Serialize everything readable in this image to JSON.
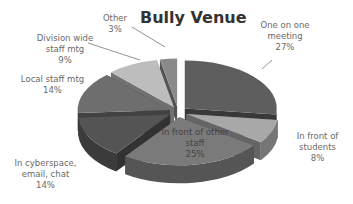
{
  "chart_data": {
    "type": "pie",
    "style": "3d-exploded",
    "title": "Bully Venue",
    "categories": [
      "One on one meeting",
      "In front of students",
      "In front of other staff",
      "In cyberspace, email, chat",
      "Local staff mtg",
      "Division wide staff mtg",
      "Other"
    ],
    "values": [
      27,
      8,
      25,
      14,
      14,
      9,
      3
    ],
    "unit": "%",
    "legend": "none (data labels)",
    "colors": [
      "#5e5e5e",
      "#a8a8a8",
      "#7a7a7a",
      "#545454",
      "#6e6e6e",
      "#bdbdbd",
      "#8a8a8a"
    ],
    "labels": [
      {
        "text": "One on one\nmeeting\n27%"
      },
      {
        "text": "In front of\nstudents\n8%"
      },
      {
        "text": "In front of other\nstaff\n25%"
      },
      {
        "text": "In cyberspace,\nemail, chat\n14%"
      },
      {
        "text": "Local staff mtg\n14%"
      },
      {
        "text": "Division wide\nstaff mtg\n9%"
      },
      {
        "text": "Other\n3%"
      }
    ]
  }
}
